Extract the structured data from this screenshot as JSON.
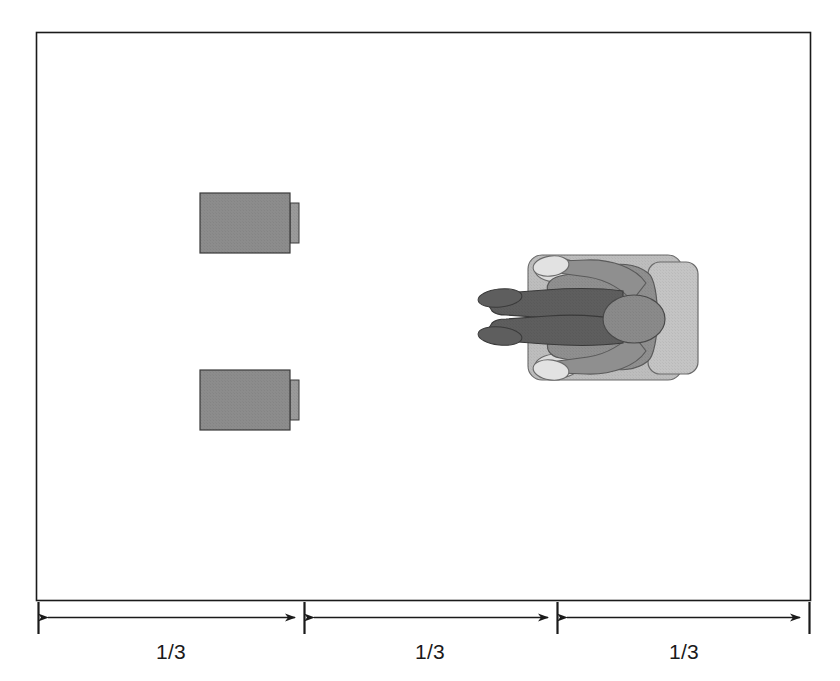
{
  "figure": {
    "type": "plan-diagram",
    "canvas": {
      "width": 840,
      "height": 681
    },
    "room": {
      "name": "room-boundary",
      "x": 36,
      "y": 32,
      "width": 774,
      "height": 568,
      "stroke": "#1a1a1a",
      "fill": "#ffffff",
      "stroke_width": 1.6
    },
    "colors": {
      "outline": "#1a1a1a",
      "unit_fill": "#8c8c8c",
      "unit_tab_fill": "#9a9a9a",
      "chair_fill": "#bdbdbd",
      "chair_back_fill": "#c4c4c4",
      "body_fill": "#8f8f8f",
      "arm_fill": "#5e5e5e",
      "hand_fill": "#dcdcdc",
      "head_fill": "#8a8a8a",
      "background": "#ffffff"
    },
    "units": [
      {
        "name": "equipment-unit-top",
        "box": {
          "x": 200,
          "y": 193,
          "width": 90,
          "height": 60
        },
        "tab": {
          "x": 290,
          "y": 203,
          "width": 9,
          "height": 40
        }
      },
      {
        "name": "equipment-unit-bottom",
        "box": {
          "x": 200,
          "y": 370,
          "width": 90,
          "height": 60
        },
        "tab": {
          "x": 290,
          "y": 380,
          "width": 9,
          "height": 40
        }
      }
    ],
    "person": {
      "name": "seated-person-plan-view",
      "facing": "left",
      "center": {
        "x": 600,
        "y": 317
      },
      "chair_seat": {
        "x": 528,
        "y": 255,
        "width": 154,
        "height": 125,
        "radius": 14
      },
      "chair_back": {
        "x": 648,
        "y": 262,
        "width": 50,
        "height": 112,
        "radius": 12
      },
      "head": {
        "cx": 634,
        "cy": 319,
        "rx": 31,
        "ry": 24
      },
      "arms_extended_count": 2,
      "hands_count": 2
    },
    "dimensions": {
      "name": "dimension-scale",
      "baseline_y": 617,
      "tick_top": 602,
      "tick_bottom": 634,
      "label_y": 659,
      "segments": [
        {
          "name": "dimension-segment-left",
          "label": "1/3",
          "x_start": 38,
          "x_end": 304,
          "label_x": 171
        },
        {
          "name": "dimension-segment-middle",
          "label": "1/3",
          "x_start": 304,
          "x_end": 557,
          "label_x": 430
        },
        {
          "name": "dimension-segment-right",
          "label": "1/3",
          "x_start": 557,
          "x_end": 810,
          "label_x": 684
        }
      ],
      "tick_positions": [
        38,
        304,
        557,
        810
      ],
      "total_label": "1/3 + 1/3 + 1/3"
    }
  }
}
